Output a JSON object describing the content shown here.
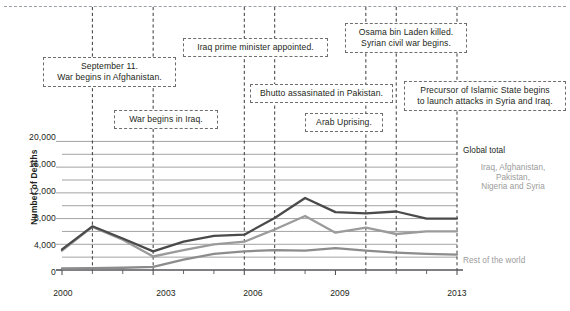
{
  "chart_data": {
    "type": "line",
    "title": "",
    "xlabel": "",
    "ylabel": "Number of Deaths",
    "x": [
      2000,
      2001,
      2002,
      2003,
      2004,
      2005,
      2006,
      2007,
      2008,
      2009,
      2010,
      2011,
      2012,
      2013
    ],
    "xlim": [
      2000,
      2013
    ],
    "ylim": [
      0,
      21000
    ],
    "grid": true,
    "legend_position": "right-inline",
    "xticks": [
      "2000",
      "2003",
      "2006",
      "2009",
      "2013"
    ],
    "xtick_values": [
      2000,
      2003,
      2006,
      2009,
      2013
    ],
    "yticks": [
      "0",
      "4,000",
      "8,000",
      "12,000",
      "16,000",
      "20,000"
    ],
    "ytick_values": [
      0,
      4000,
      8000,
      12000,
      16000,
      20000
    ],
    "minor_ytick_values": [
      2000,
      6000,
      10000,
      14000,
      18000
    ],
    "series": [
      {
        "name": "Global total",
        "color": "#4a4a4a",
        "values": [
          3200,
          6800,
          4900,
          2900,
          4400,
          5300,
          5500,
          8100,
          11200,
          9000,
          8800,
          9100,
          8000,
          8000
        ]
      },
      {
        "name": "Iraq, Afghanistan, Pakistan, Nigeria and Syria",
        "color": "#9b9b9b",
        "values": [
          3000,
          6700,
          4700,
          2100,
          3100,
          4000,
          4400,
          6300,
          8400,
          5800,
          6600,
          5600,
          6000,
          6000
        ]
      },
      {
        "name": "Rest of the world",
        "color": "#8c8c8c",
        "values": [
          250,
          300,
          350,
          500,
          1600,
          2500,
          2900,
          3100,
          3000,
          3400,
          3000,
          2700,
          2500,
          2400
        ]
      }
    ],
    "series_actual": {
      "global_total": [
        3200,
        6800,
        4900,
        2900,
        4400,
        5300,
        5500,
        8100,
        11200,
        9000,
        8800,
        9100,
        8000,
        8000
      ],
      "five_countries": [
        3000,
        6700,
        4700,
        2100,
        3100,
        4000,
        4400,
        6300,
        8400,
        5800,
        6600,
        5600,
        6000,
        6000
      ],
      "rest_of_world": [
        250,
        300,
        350,
        500,
        1600,
        2500,
        2900,
        3100,
        3000,
        3400,
        3000,
        2700,
        2500,
        2400
      ]
    },
    "annotations": [
      {
        "id": "sept11",
        "year": 2001,
        "text": "September 11.\nWar begins in Afghanistan."
      },
      {
        "id": "iraq-war",
        "year": 2003,
        "text": "War begins in Iraq."
      },
      {
        "id": "iraq-pm",
        "year": 2006,
        "text": "Iraq prime minister appointed."
      },
      {
        "id": "bhutto",
        "year": 2007,
        "text": "Bhutto assasinated in Pakistan."
      },
      {
        "id": "arab-spring",
        "year": 2010,
        "text": "Arab Uprising."
      },
      {
        "id": "binladen",
        "year": 2011,
        "text": "Osama bin Laden killed.\nSyrian civil war begins."
      },
      {
        "id": "isis",
        "year": 2013,
        "text": "Precursor of Islamic State begins\nto launch attacks in Syria and Iraq."
      }
    ]
  },
  "axis": {
    "y_title": "Number of Deaths",
    "y_ticks": [
      "20,000",
      "16,000",
      "12,000",
      "8,000",
      "4,000",
      "0"
    ],
    "x_ticks": [
      "2000",
      "2003",
      "2006",
      "2009",
      "2013"
    ]
  },
  "series_labels": {
    "global": "Global total",
    "five": "Iraq, Afghanistan,\nPakistan,\nNigeria and Syria",
    "rest": "Rest of the world"
  },
  "annotations": {
    "sept11": "September 11.\nWar begins in Afghanistan.",
    "iraq_war": "War begins in Iraq.",
    "iraq_pm": "Iraq prime minister appointed.",
    "bhutto": "Bhutto assasinated in Pakistan.",
    "arab_uprising": "Arab Uprising.",
    "binladen": "Osama bin Laden killed.\nSyrian civil war begins.",
    "isis": "Precursor of Islamic State begins\nto launch attacks in Syria and Iraq."
  },
  "colors": {
    "global_total": "#4a4a4a",
    "five_countries": "#9b9b9b",
    "rest_of_world": "#8c8c8c",
    "gridline": "#8c8c8c",
    "event_line": "#3a3a3a",
    "box_border": "#6e6e6e",
    "text": "#231f20"
  }
}
